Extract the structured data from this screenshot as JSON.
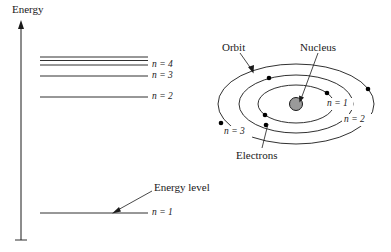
{
  "figure": {
    "title_axis": "Energy",
    "width": 391,
    "height": 252,
    "background": "#ffffff",
    "ink_color": "#1a1a1a",
    "nucleus_fill": "#9a9a9a",
    "electron_fill": "#000000"
  },
  "energy_diagram": {
    "axis_label": "Energy",
    "levels": [
      {
        "id": "n5plus",
        "label": "",
        "n": "",
        "y": 57,
        "x1": 40,
        "x2": 148,
        "has_label": false
      },
      {
        "id": "n4b",
        "label": "",
        "n": "",
        "y": 60,
        "x1": 40,
        "x2": 148,
        "has_label": false
      },
      {
        "id": "n4",
        "label": "n = 4",
        "n": "4",
        "y": 65,
        "x1": 40,
        "x2": 148,
        "has_label": true
      },
      {
        "id": "n3",
        "label": "n = 3",
        "n": "3",
        "y": 76,
        "x1": 40,
        "x2": 148,
        "has_label": true
      },
      {
        "id": "n2",
        "label": "n = 2",
        "n": "2",
        "y": 97,
        "x1": 40,
        "x2": 148,
        "has_label": true
      },
      {
        "id": "n1",
        "label": "n = 1",
        "n": "1",
        "y": 213,
        "x1": 40,
        "x2": 148,
        "has_label": true
      }
    ],
    "annotation": {
      "label": "Energy level",
      "target_label": "n = 1"
    }
  },
  "bohr_model": {
    "labels": {
      "orbit": "Orbit",
      "nucleus": "Nucleus",
      "electrons": "Electrons"
    },
    "shells": [
      {
        "id": "shell1",
        "label": "n = 1",
        "n": "1",
        "rx": 38,
        "ry": 19
      },
      {
        "id": "shell2",
        "label": "n = 2",
        "n": "2",
        "rx": 57,
        "ry": 29
      },
      {
        "id": "shell3",
        "label": "n = 3",
        "n": "3",
        "rx": 78,
        "ry": 40
      }
    ],
    "electrons": [
      {
        "shell": 1,
        "angle_deg": 35
      },
      {
        "shell": 1,
        "angle_deg": 205
      },
      {
        "shell": 2,
        "angle_deg": 118
      },
      {
        "shell": 2,
        "angle_deg": 258
      },
      {
        "shell": 3,
        "angle_deg": 22
      },
      {
        "shell": 3,
        "angle_deg": 192
      }
    ],
    "nucleus": {
      "cx": 296,
      "cy": 104,
      "r": 6
    }
  }
}
